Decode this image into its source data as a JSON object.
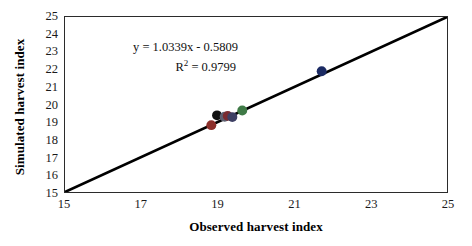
{
  "chart_data": {
    "type": "scatter",
    "title": "",
    "xlabel": "Observed harvest index",
    "ylabel": "Simulated harvest index",
    "xlim": [
      15,
      25
    ],
    "ylim": [
      15,
      25
    ],
    "grid": false,
    "legend": null,
    "xticks": [
      15,
      17,
      19,
      21,
      23,
      25
    ],
    "xtick_labels": [
      "15",
      "17",
      "19",
      "21",
      "23",
      "25"
    ],
    "yticks": [
      15,
      16,
      17,
      18,
      19,
      20,
      21,
      22,
      23,
      24,
      25
    ],
    "ytick_labels": [
      "15",
      "16",
      "17",
      "18",
      "19",
      "20",
      "21",
      "22",
      "23",
      "24",
      "25"
    ],
    "points": [
      {
        "x": 18.83,
        "y": 18.82,
        "color": "#8c2f2a"
      },
      {
        "x": 18.98,
        "y": 19.38,
        "color": "#121212"
      },
      {
        "x": 19.18,
        "y": 19.3,
        "color": "#5c5f70"
      },
      {
        "x": 19.26,
        "y": 19.35,
        "color": "#7a2b30"
      },
      {
        "x": 19.38,
        "y": 19.28,
        "color": "#3d3f63"
      },
      {
        "x": 19.64,
        "y": 19.66,
        "color": "#3f7a46"
      },
      {
        "x": 21.72,
        "y": 21.9,
        "color": "#1b2a63"
      }
    ],
    "marker_size_px": 10,
    "reference_line": {
      "label": "1:1 line",
      "from": [
        15,
        15
      ],
      "to": [
        25,
        25
      ],
      "color": "#000000",
      "width_px": 2.6
    },
    "annotation": {
      "equation": "y = 1.0339x - 0.5809",
      "r_squared_prefix": "R",
      "r_squared_exponent": "2",
      "r_squared_value": " = 0.9799"
    }
  },
  "style": {
    "background": "#ffffff",
    "axis_color": "#2b2b2b",
    "text_color": "#111111"
  }
}
